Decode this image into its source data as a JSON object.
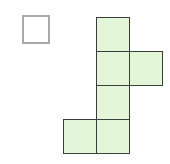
{
  "diagram": {
    "colors": {
      "fill": "#e4f6d8",
      "stroke": "#3a3f3a",
      "empty_stroke": "#a9a9a9"
    },
    "cell_size": 34,
    "empty_square": {
      "x": 22,
      "y": 15,
      "size": 28
    },
    "cells": [
      {
        "x": 96,
        "y": 17
      },
      {
        "x": 96,
        "y": 51
      },
      {
        "x": 129,
        "y": 51
      },
      {
        "x": 96,
        "y": 85
      },
      {
        "x": 96,
        "y": 119
      },
      {
        "x": 63,
        "y": 119
      }
    ]
  }
}
